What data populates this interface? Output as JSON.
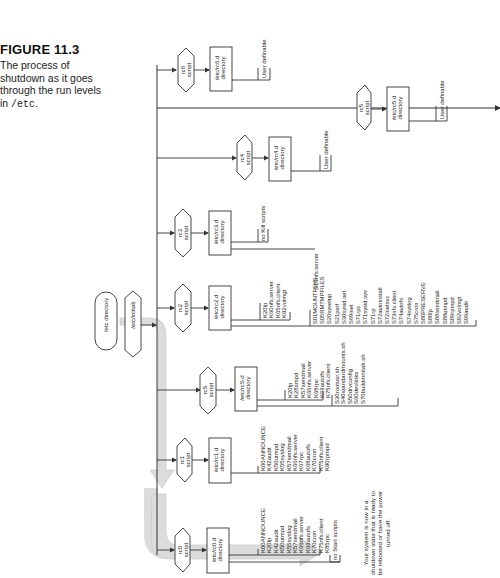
{
  "caption": {
    "figure_number": "FIGURE 11.3",
    "line1": "The process of",
    "line2": "shutdown as it goes",
    "line3": "through the run levels",
    "line4_prefix": "in ",
    "line4_code": "/etc",
    "line4_suffix": "."
  },
  "start": {
    "etc_directory": "/etc directory",
    "inittab": "/etc/inittab"
  },
  "runlevels": [
    {
      "id": "rc0",
      "script_line1": "rc0",
      "script_line2": "script",
      "dir_line1": "/etc/rc0.d",
      "dir_line2": "directory",
      "kill_scripts": [
        "K00ANNOUNCE",
        "K20lp",
        "K42audit",
        "K50utmpd",
        "K55syslog",
        "K57sendmail",
        "K66nfs.server",
        "K69autofs",
        "K70cron",
        "K75nfs.client",
        "K85rpc"
      ],
      "start_scripts_label": "no Start scripts"
    },
    {
      "id": "rc1",
      "script_line1": "rc1",
      "script_line2": "script",
      "dir_line1": "/etc/rc1.d",
      "dir_line2": "directory",
      "kill_scripts": [
        "K00ANNOUNCE",
        "K42audit",
        "K50utmpd",
        "K55syslog",
        "K57sendmail",
        "K66nfs.server",
        "K67rpc",
        "K68autofs",
        "K70cron",
        "K75nfs.client",
        "K90rpmpd"
      ]
    },
    {
      "id": "rcS",
      "script_line1": "rcS",
      "script_line2": "script",
      "dir_line1": "/etc/rcS.d",
      "dir_line2": "directory",
      "kill_scripts": [
        "K20lp",
        "K28smpd",
        "K57sendmail",
        "K66nfs.server",
        "K68rpc",
        "K69autofs",
        "K75nfs.client"
      ],
      "start_scripts": [
        "S30rootusr.sh",
        "S40standardmounts.sh",
        "S50drvconfig",
        "S60devlinks",
        "S70buildmnttab.sh"
      ]
    },
    {
      "id": "rc2",
      "script_line1": "rc2",
      "script_line2": "script",
      "dir_line1": "/etc/rc2.d",
      "dir_line2": "directory",
      "kill_scripts": [
        "K20lp",
        "K60nfs.server",
        "K65nfs.client",
        "K92volmgt"
      ],
      "start_scripts": [
        "S01MOUNTFSYS",
        "S05RMTMPFILES",
        "S20sysetup",
        "S21perf",
        "S30sysid.net",
        "S69inet",
        "S71rpc",
        "S71sysid.sys",
        "S71rp",
        "S72autoinstall",
        "S72inetsvc",
        "S73nfs.client",
        "S74autofs",
        "S74syslog",
        "S75cron",
        "S80PRESERVE",
        "S80lp",
        "S88sendmail",
        "S88utmpd",
        "S89rpmpd",
        "S92volmgt",
        "S99audit"
      ]
    },
    {
      "id": "rc3",
      "script_line1": "rc3",
      "script_line2": "script",
      "dir_line1": "/etc/rc3.d",
      "dir_line2": "directory",
      "kill_scripts_label": "no Kill scripts",
      "start_scripts": [
        "S15nfs.server"
      ]
    },
    {
      "id": "rc4",
      "script_line1": "rc4",
      "script_line2": "script",
      "dir_line1": "/etc/rc4.d",
      "dir_line2": "directory",
      "user_label": "User definable"
    },
    {
      "id": "rc5",
      "script_line1": "rc5",
      "script_line2": "script",
      "dir_line1": "/etc/rc5.d",
      "dir_line2": "directory",
      "user_label": "User definable"
    },
    {
      "id": "rc6",
      "script_line1": "rc6",
      "script_line2": "script",
      "dir_line1": "/etc/rc6.d",
      "dir_line2": "directory",
      "user_label": "User definable"
    }
  ],
  "final_note": {
    "line1": "Your system is now in a",
    "line2": "shutdown state that is ready to",
    "line3": "be rebooted or have the power",
    "line4": "turned off."
  },
  "colors": {
    "line": "#333333",
    "flow_arrow": "#d9d9d9",
    "flow_arrow_edge": "#bdbdbd"
  }
}
